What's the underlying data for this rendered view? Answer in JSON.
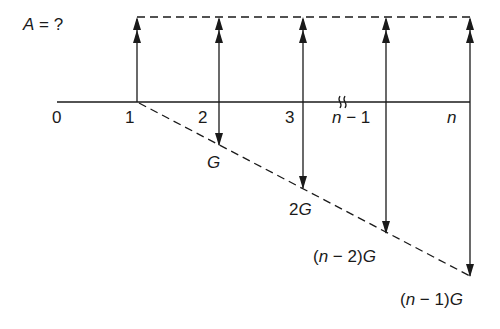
{
  "title_label": {
    "var": "A",
    "rest": " = ?"
  },
  "axis": {
    "ticks": [
      {
        "label": "0",
        "x": 57
      },
      {
        "label": "1",
        "x": 137
      },
      {
        "label": "2",
        "x": 219
      },
      {
        "label": "3",
        "x": 303
      },
      {
        "label_var": "n",
        "label_rest": " − 1",
        "x": 386
      },
      {
        "label_var": "n",
        "x": 470
      }
    ],
    "break_marker": "≈"
  },
  "uniform_series": {
    "label": "A",
    "periods": [
      "1",
      "2",
      "3",
      "n − 1",
      "n"
    ],
    "direction": "up",
    "arrowheads": "double"
  },
  "gradient_series": {
    "direction": "down",
    "labels": [
      {
        "period": "1",
        "text": "0"
      },
      {
        "period": "2",
        "prefix": "",
        "var": "G"
      },
      {
        "period": "3",
        "prefix": "2",
        "var": "G"
      },
      {
        "period": "n − 1",
        "prefix": "(n − 2)",
        "var": "G"
      },
      {
        "period": "n",
        "prefix": "(n − 1)",
        "var": "G"
      }
    ]
  },
  "label_texts": {
    "g1": "G",
    "g2_num": "2",
    "g2_var": "G",
    "gn2_open": "(",
    "gn2_n": "n",
    "gn2_rest": " − 2)",
    "gn2_var": "G",
    "gn1_open": "(",
    "gn1_n": "n",
    "gn1_rest": " − 1)",
    "gn1_var": "G",
    "tick0": "0",
    "tick1": "1",
    "tick2": "2",
    "tick3": "3",
    "tickn1_n": "n",
    "tickn1_rest": " − 1",
    "tickn": "n",
    "a_var": "A",
    "a_rest": " = ?"
  }
}
